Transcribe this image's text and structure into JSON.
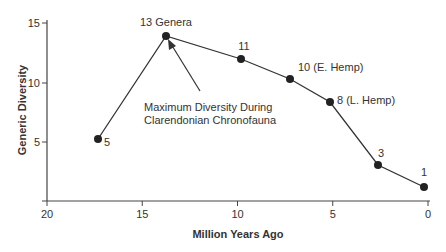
{
  "chart_data": {
    "type": "line",
    "title": "",
    "xlabel": "Million Years Ago",
    "ylabel": "Generic Diversity",
    "xlim": [
      20,
      0
    ],
    "ylim": [
      0,
      15
    ],
    "x_ticks": [
      "20",
      "15",
      "10",
      "5",
      "0"
    ],
    "y_ticks": [
      "5",
      "10",
      "15"
    ],
    "grid": false,
    "legend": null,
    "series": [
      {
        "name": "Generic Diversity",
        "x": [
          17.2,
          13.8,
          9.8,
          7.2,
          5.1,
          2.7,
          0.3
        ],
        "values": [
          5,
          13,
          11,
          10,
          8,
          3,
          1
        ],
        "point_labels": [
          "5",
          "13 Genera",
          "11",
          "10 (E. Hemp)",
          "8 (L. Hemp)",
          "3",
          "1"
        ]
      }
    ],
    "annotations": [
      {
        "text_line1": "Maximum Diversity During",
        "text_line2": "Clarendonian Chronofauna",
        "points_to": "13 Genera"
      }
    ],
    "colors": {
      "line": "#333333",
      "point": "#222222",
      "axis": "#444444",
      "text": "#333333"
    }
  }
}
